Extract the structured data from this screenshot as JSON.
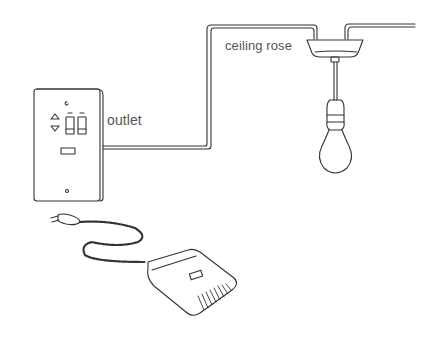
{
  "diagram": {
    "labels": {
      "outlet": "outlet",
      "ceiling_rose": "ceiling rose"
    },
    "outlet_glyphs": {
      "top_mark": "c",
      "up_arrow": "△",
      "down_arrow": "▽"
    },
    "colors": {
      "line": "#333333",
      "label": "#555555",
      "background": "#ffffff"
    }
  }
}
